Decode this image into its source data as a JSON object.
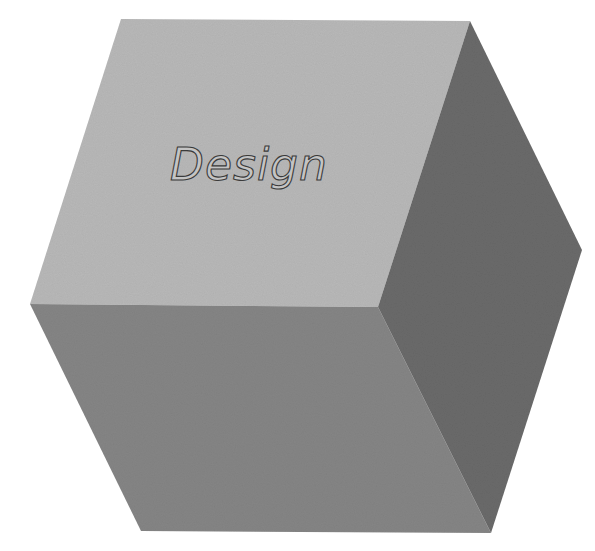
{
  "diagram": {
    "type": "isometric-cube",
    "label": "Design",
    "colors": {
      "background": "#ffffff",
      "top_face": "#b8b8b8",
      "front_face": "#858585",
      "right_face": "#6a6a6a",
      "label_fill": "#c4c4c4",
      "label_stroke": "#3a3a3a"
    },
    "faces": [
      {
        "name": "top",
        "points": "121,19 470,21 378,307 30,304"
      },
      {
        "name": "front",
        "points": "30,304 378,307 491,533 141,531"
      },
      {
        "name": "right",
        "points": "470,21 582,250 491,533 378,307"
      }
    ]
  }
}
